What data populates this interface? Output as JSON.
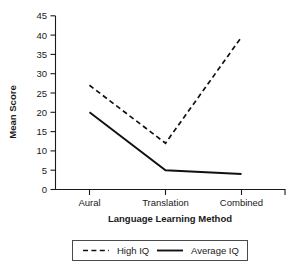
{
  "chart_data": {
    "type": "line",
    "title": "",
    "xlabel": "Language Learning Method",
    "ylabel": "Mean Score",
    "categories": [
      "Aural",
      "Translation",
      "Combined"
    ],
    "series": [
      {
        "name": "High IQ",
        "values": [
          27,
          12,
          39.5
        ],
        "style": "dashed"
      },
      {
        "name": "Average IQ",
        "values": [
          20,
          5,
          4
        ],
        "style": "solid"
      }
    ],
    "ylim": [
      0,
      45
    ],
    "yticks": [
      0,
      5,
      10,
      15,
      20,
      25,
      30,
      35,
      40,
      45
    ],
    "ytick_labels": [
      "0",
      "5",
      "10",
      "15",
      "20",
      "25",
      "30",
      "35",
      "40",
      "45"
    ],
    "grid": false,
    "legend_position": "bottom",
    "line_color": "#111111"
  },
  "axes": {
    "y_title": "Mean Score",
    "x_title": "Language Learning Method"
  },
  "legend": {
    "entries": [
      {
        "label": "High IQ",
        "marker": "dashed-line-swatch"
      },
      {
        "label": "Average IQ",
        "marker": "solid-line-swatch"
      }
    ]
  }
}
